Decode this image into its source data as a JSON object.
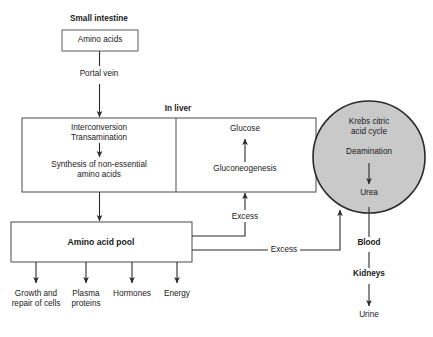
{
  "diagram": {
    "colors": {
      "background": "#ffffff",
      "stroke": "#2b2b2b",
      "box_fill": "#ffffff",
      "circle_fill": "#c9c9c9",
      "text": "#1a1a1a"
    },
    "nodes": {
      "small_intestine": "Small intestine",
      "amino_acids": "Amino acids",
      "portal_vein": "Portal vein",
      "in_liver": "In liver",
      "interconversion": "Interconversion",
      "transamination": "Transamination",
      "synthesis": "Synthesis of non-essential",
      "synthesis_line2": "amino acids",
      "glucose": "Glucose",
      "gluconeogenesis": "Gluconeogenesis",
      "krebs_line1": "Krebs citric",
      "krebs_line2": "acid cycle",
      "deamination": "Deamination",
      "urea": "Urea",
      "blood": "Blood",
      "kidneys": "Kidneys",
      "urine": "Urine",
      "amino_acid_pool": "Amino acid pool",
      "excess_upper": "Excess",
      "excess_lower": "Excess"
    },
    "outputs": [
      {
        "line1": "Growth and",
        "line2": "repair of cells"
      },
      {
        "line1": "Plasma",
        "line2": "proteins"
      },
      {
        "line1": "Hormones",
        "line2": ""
      },
      {
        "line1": "Energy",
        "line2": ""
      }
    ]
  }
}
